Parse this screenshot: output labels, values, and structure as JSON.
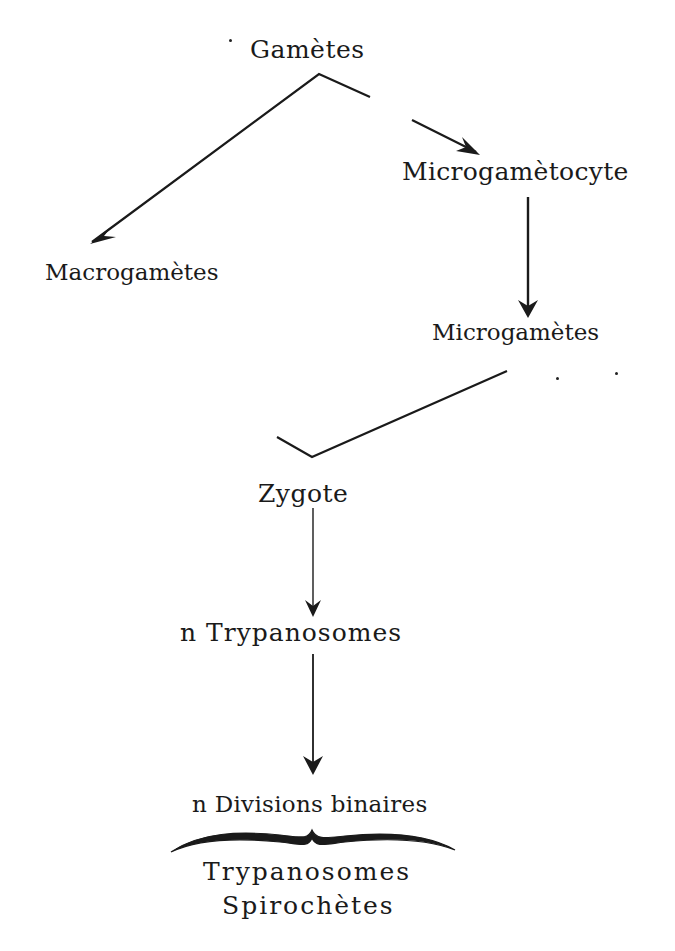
{
  "diagram": {
    "type": "life-cycle flowchart",
    "nodes": {
      "gametes": "Gamètes",
      "microgametocyte": "Microgamètocyte",
      "macrogametes": "Macrogamètes",
      "microgametes": "Microgamètes",
      "zygote": "Zygote",
      "n_trypanosomes": "n Trypanosomes",
      "n_divisions": "n Divisions binaires",
      "result_line1": "Trypanosomes",
      "result_line2": "Spirochètes"
    },
    "edges": [
      {
        "from": "Gamètes",
        "to": "Macrogamètes"
      },
      {
        "from": "Gamètes",
        "to": "Microgamètocyte"
      },
      {
        "from": "Microgamètocyte",
        "to": "Microgamètes"
      },
      {
        "from": "Microgamètes",
        "to": "Zygote"
      },
      {
        "from": "Zygote",
        "to": "n Trypanosomes"
      },
      {
        "from": "n Trypanosomes",
        "to": "n Divisions binaires"
      },
      {
        "from": "n Divisions binaires",
        "to": "Trypanosomes / Spirochètes",
        "style": "brace"
      }
    ],
    "colors": {
      "ink": "#1a1a1a",
      "background": "#ffffff"
    }
  }
}
